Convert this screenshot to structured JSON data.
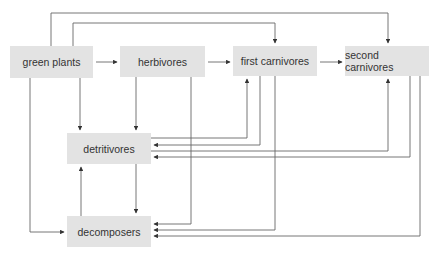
{
  "diagram": {
    "type": "food web",
    "colors": {
      "node_fill": "#e3e3e3",
      "edge": "#555555",
      "text": "#333333"
    },
    "nodes": [
      {
        "id": "green_plants",
        "label": "green plants"
      },
      {
        "id": "herbivores",
        "label": "herbivores"
      },
      {
        "id": "first_carnivores",
        "label": "first carnivores"
      },
      {
        "id": "second_carnivores",
        "label": "second carnivores"
      },
      {
        "id": "detritivores",
        "label": "detritivores"
      },
      {
        "id": "decomposers",
        "label": "decomposers"
      }
    ],
    "edges": [
      {
        "from": "green_plants",
        "to": "herbivores"
      },
      {
        "from": "herbivores",
        "to": "first_carnivores"
      },
      {
        "from": "first_carnivores",
        "to": "second_carnivores"
      },
      {
        "from": "green_plants",
        "to": "first_carnivores"
      },
      {
        "from": "green_plants",
        "to": "second_carnivores"
      },
      {
        "from": "green_plants",
        "to": "detritivores"
      },
      {
        "from": "green_plants",
        "to": "decomposers"
      },
      {
        "from": "herbivores",
        "to": "detritivores"
      },
      {
        "from": "herbivores",
        "to": "decomposers"
      },
      {
        "from": "detritivores",
        "to": "first_carnivores"
      },
      {
        "from": "first_carnivores",
        "to": "detritivores"
      },
      {
        "from": "first_carnivores",
        "to": "decomposers"
      },
      {
        "from": "detritivores",
        "to": "second_carnivores"
      },
      {
        "from": "second_carnivores",
        "to": "detritivores"
      },
      {
        "from": "second_carnivores",
        "to": "decomposers"
      },
      {
        "from": "detritivores",
        "to": "decomposers"
      },
      {
        "from": "decomposers",
        "to": "detritivores"
      }
    ]
  }
}
